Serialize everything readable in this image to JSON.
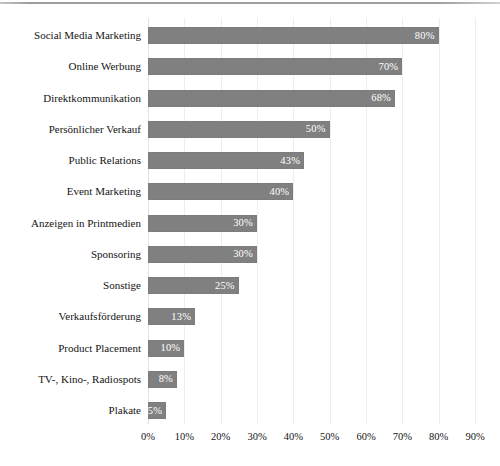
{
  "chart_data": {
    "type": "bar",
    "orientation": "horizontal",
    "title": "",
    "subtitle": "",
    "xlabel": "",
    "ylabel": "",
    "xlim": [
      0,
      90
    ],
    "xtick_labels": [
      "0%",
      "10%",
      "20%",
      "30%",
      "40%",
      "50%",
      "60%",
      "70%",
      "80%",
      "90%"
    ],
    "xticks": [
      0,
      10,
      20,
      30,
      40,
      50,
      60,
      70,
      80,
      90
    ],
    "grid": true,
    "legend": "none",
    "bar_color": "#808080",
    "value_label_color": "#ffffff",
    "categories": [
      "Social Media Marketing",
      "Online Werbung",
      "Direktkommunikation",
      "Persönlicher Verkauf",
      "Public Relations",
      "Event Marketing",
      "Anzeigen in Printmedien",
      "Sponsoring",
      "Sonstige",
      "Verkaufsförderung",
      "Product Placement",
      "TV-, Kino-, Radiospots",
      "Plakate"
    ],
    "values": [
      80,
      70,
      68,
      50,
      43,
      40,
      30,
      30,
      25,
      13,
      10,
      8,
      5
    ],
    "value_labels": [
      "80%",
      "70%",
      "68%",
      "50%",
      "43%",
      "40%",
      "30%",
      "30%",
      "25%",
      "13%",
      "10%",
      "8%",
      "5%"
    ]
  }
}
